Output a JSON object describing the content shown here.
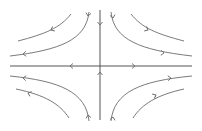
{
  "diagram": {
    "type": "phase-portrait",
    "colors": {
      "background": "#ffffff",
      "stroke": "#6b6b6b",
      "axis": "#555555"
    },
    "axes": {
      "horizontal": {
        "x1": 10,
        "y1": 66,
        "x2": 192,
        "y2": 66,
        "flow": "outward"
      },
      "vertical": {
        "x1": 100,
        "y1": 10,
        "x2": 100,
        "y2": 120,
        "flow": "inward"
      }
    },
    "trajectories": [
      {
        "quadrant": "top-left",
        "position": "near",
        "d": "M 89 12 C 86 40, 60 50, 10 56"
      },
      {
        "quadrant": "top-left",
        "position": "far",
        "d": "M 71 14 C 60 28, 45 34, 18 41"
      },
      {
        "quadrant": "top-right",
        "position": "near",
        "d": "M 111 12 C 114 40, 140 50, 192 56"
      },
      {
        "quadrant": "top-right",
        "position": "far",
        "d": "M 131 14 C 142 28, 157 34, 184 41"
      },
      {
        "quadrant": "bottom-left",
        "position": "near",
        "d": "M 10 76 C 60 81, 86 92, 89 121"
      },
      {
        "quadrant": "bottom-left",
        "position": "far",
        "d": "M 16 89 C 45 95, 60 104, 69 118"
      },
      {
        "quadrant": "bottom-right",
        "position": "near",
        "d": "M 192 76 C 140 81, 114 92, 111 121"
      },
      {
        "quadrant": "bottom-right",
        "position": "far",
        "d": "M 184 89 C 157 95, 142 104, 133 118"
      }
    ],
    "arrows": [
      {
        "name": "axis-top-arrow",
        "x": 100,
        "y": 25,
        "angle": 90
      },
      {
        "name": "axis-bottom-arrow",
        "x": 100,
        "y": 72,
        "angle": -90
      },
      {
        "name": "axis-left-arrow",
        "x": 70,
        "y": 66,
        "angle": 180
      },
      {
        "name": "axis-right-arrow",
        "x": 135,
        "y": 66,
        "angle": 0
      },
      {
        "name": "tl-near-top-arrow",
        "x": 88,
        "y": 16,
        "angle": 100
      },
      {
        "name": "tl-near-left-arrow",
        "x": 23,
        "y": 54,
        "angle": 175
      },
      {
        "name": "tl-far-arrow",
        "x": 51,
        "y": 30,
        "angle": 155
      },
      {
        "name": "tr-near-top-arrow",
        "x": 113,
        "y": 18,
        "angle": 80
      },
      {
        "name": "tr-near-right-arrow",
        "x": 164,
        "y": 53,
        "angle": 5
      },
      {
        "name": "tr-far-arrow",
        "x": 148,
        "y": 30,
        "angle": 25
      },
      {
        "name": "bl-near-left-arrow",
        "x": 23,
        "y": 78,
        "angle": 185
      },
      {
        "name": "bl-near-bottom-arrow",
        "x": 88,
        "y": 115,
        "angle": -100
      },
      {
        "name": "bl-far-arrow",
        "x": 28,
        "y": 93,
        "angle": 200
      },
      {
        "name": "br-near-right-arrow",
        "x": 171,
        "y": 78,
        "angle": -5
      },
      {
        "name": "br-near-bottom-arrow",
        "x": 113,
        "y": 117,
        "angle": -80
      },
      {
        "name": "br-far-arrow",
        "x": 156,
        "y": 95,
        "angle": -25
      }
    ]
  }
}
